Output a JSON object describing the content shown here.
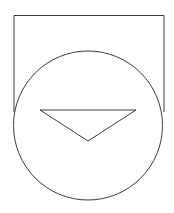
{
  "diagram": {
    "background": "#ffffff",
    "stroke_color": "#3a3a3a",
    "stroke_width": 1,
    "shapes": {
      "rectangle": {
        "x": 14,
        "y": 15,
        "width": 150,
        "height": 110,
        "open_bottom": true
      },
      "circle": {
        "cx": 88,
        "cy": 125.5,
        "r": 74.5
      },
      "triangle": {
        "points": "40,110 136,110 88,141",
        "orientation": "pointing-down"
      }
    }
  }
}
